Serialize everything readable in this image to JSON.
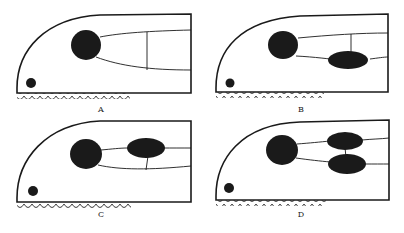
{
  "figure": {
    "panels": [
      {
        "id": "A",
        "label": "A",
        "ovals": 0,
        "variant": "lines-with-vertical-connector"
      },
      {
        "id": "B",
        "label": "B",
        "ovals": 1,
        "variant": "lower-oval-with-vertical-connector"
      },
      {
        "id": "C",
        "label": "C",
        "ovals": 1,
        "variant": "upper-oval-with-vertical-connector"
      },
      {
        "id": "D",
        "label": "D",
        "ovals": 2,
        "variant": "two-stacked-ovals"
      }
    ],
    "colors": {
      "ink": "#1a1a1a",
      "background": "#ffffff"
    }
  }
}
